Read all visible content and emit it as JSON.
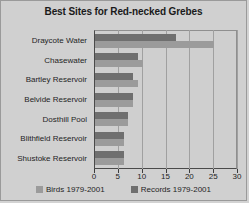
{
  "chart_data": {
    "type": "bar",
    "orientation": "horizontal",
    "title": "Best Sites for Red-necked Grebes",
    "xlabel": "",
    "ylabel": "",
    "xlim": [
      0,
      30
    ],
    "xticks": [
      0,
      5,
      10,
      15,
      20,
      25,
      30
    ],
    "grid": true,
    "legend_position": "bottom",
    "categories": [
      "Draycote Water",
      "Chasewater",
      "Bartley Reservoir",
      "Belvide Reservoir",
      "Dosthill Pool",
      "Blithfield Reservoir",
      "Shustoke Reservoir"
    ],
    "series": [
      {
        "name": "Records 1979-2001",
        "color": "#6f6f6f",
        "values": [
          17,
          9,
          8,
          8,
          7,
          6,
          6
        ]
      },
      {
        "name": "Birds 1979-2001",
        "color": "#9b9b9b",
        "values": [
          25,
          10,
          9,
          8,
          7,
          6,
          6
        ]
      }
    ]
  },
  "legend": {
    "items": [
      {
        "label": "Birds 1979-2001",
        "swatch": "birds"
      },
      {
        "label": "Records 1979-2001",
        "swatch": "records"
      }
    ]
  },
  "colors": {
    "background": "#d0d0d0",
    "plot_background": "#cfcfcf",
    "border": "#9a9a9a",
    "axis": "#3c3c3c",
    "gridline": "#a0a0a0",
    "text": "#1f1f1f"
  }
}
